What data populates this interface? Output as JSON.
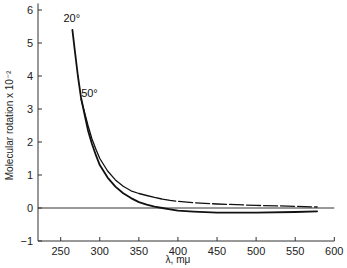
{
  "chart_data": {
    "type": "line",
    "title": "",
    "xlabel": "λ, mμ",
    "ylabel": "Molecular rotation x 10⁻²",
    "xlim": [
      221,
      600
    ],
    "ylim": [
      -1,
      6.2
    ],
    "x_ticks": [
      250,
      300,
      350,
      400,
      450,
      500,
      550,
      600
    ],
    "y_ticks": [
      -1,
      0,
      1,
      2,
      3,
      4,
      5,
      6
    ],
    "grid": false,
    "legend": "none",
    "reference_line": {
      "y": 0,
      "x_from": 221,
      "x_to": 600
    },
    "series": [
      {
        "name": "20°",
        "style": "solid",
        "label_position": {
          "x": 265,
          "y": 5.65
        },
        "x": [
          265,
          268,
          272,
          276,
          280,
          285,
          290,
          295,
          300,
          310,
          320,
          330,
          340,
          350,
          360,
          370,
          380,
          390,
          400,
          420,
          450,
          500,
          550,
          578
        ],
        "y": [
          5.4,
          4.8,
          4.0,
          3.35,
          2.9,
          2.35,
          1.95,
          1.6,
          1.3,
          0.92,
          0.65,
          0.45,
          0.3,
          0.18,
          0.1,
          0.04,
          0.0,
          -0.04,
          -0.08,
          -0.11,
          -0.14,
          -0.14,
          -0.12,
          -0.1
        ]
      },
      {
        "name": "50°",
        "style": "dashed",
        "label_position": {
          "x": 280,
          "y": 3.35
        },
        "x": [
          276,
          280,
          285,
          290,
          295,
          300,
          310,
          320,
          330,
          340,
          350,
          360,
          370,
          380,
          390,
          400,
          420,
          450,
          500,
          550,
          578
        ],
        "y": [
          3.3,
          2.95,
          2.5,
          2.1,
          1.78,
          1.5,
          1.12,
          0.85,
          0.66,
          0.52,
          0.44,
          0.38,
          0.32,
          0.27,
          0.23,
          0.2,
          0.16,
          0.12,
          0.08,
          0.05,
          0.03
        ]
      }
    ]
  }
}
